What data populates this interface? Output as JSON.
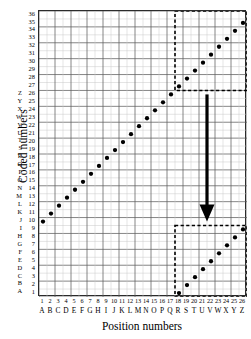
{
  "chart_data": {
    "type": "scatter",
    "title": "",
    "xlabel": "Position numbers",
    "ylabel": "Coded numbers",
    "xlim": [
      0.5,
      26.5
    ],
    "ylim": [
      0.5,
      36.5
    ],
    "grid": true,
    "legend": false,
    "x_tick_numbers": [
      "1",
      "2",
      "3",
      "4",
      "5",
      "6",
      "7",
      "8",
      "9",
      "10",
      "11",
      "12",
      "13",
      "14",
      "15",
      "16",
      "17",
      "18",
      "19",
      "20",
      "21",
      "22",
      "23",
      "24",
      "25",
      "26"
    ],
    "x_tick_letters": [
      "A",
      "B",
      "C",
      "D",
      "E",
      "F",
      "G",
      "H",
      "I",
      "J",
      "K",
      "L",
      "M",
      "N",
      "O",
      "P",
      "Q",
      "R",
      "S",
      "T",
      "U",
      "V",
      "W",
      "X",
      "Y",
      "Z"
    ],
    "y_tick_numbers": [
      "1",
      "2",
      "3",
      "4",
      "5",
      "6",
      "7",
      "8",
      "9",
      "10",
      "11",
      "12",
      "13",
      "14",
      "15",
      "16",
      "17",
      "18",
      "19",
      "20",
      "21",
      "22",
      "23",
      "24",
      "25",
      "26",
      "27",
      "28",
      "29",
      "30",
      "31",
      "32",
      "33",
      "34",
      "35",
      "36"
    ],
    "y_tick_letters": [
      "A",
      "B",
      "C",
      "D",
      "E",
      "F",
      "G",
      "H",
      "I",
      "J",
      "K",
      "L",
      "M",
      "N",
      "O",
      "P",
      "Q",
      "R",
      "S",
      "T",
      "U",
      "V",
      "W",
      "X",
      "Y",
      "Z",
      "",
      "",
      "",
      "",
      "",
      "",
      "",
      "",
      "",
      ""
    ],
    "series": [
      {
        "name": "coded mapping",
        "marker": "filled-circle",
        "color": "#000000",
        "x": [
          1,
          2,
          3,
          4,
          5,
          6,
          7,
          8,
          9,
          10,
          11,
          12,
          13,
          14,
          15,
          16,
          17,
          18,
          19,
          20,
          21,
          22,
          23,
          24,
          25,
          26
        ],
        "y": [
          10,
          11,
          12,
          13,
          14,
          15,
          16,
          17,
          18,
          19,
          20,
          21,
          22,
          23,
          24,
          25,
          26,
          27,
          28,
          29,
          30,
          31,
          32,
          33,
          34,
          35
        ]
      },
      {
        "name": "wrapped mapping",
        "marker": "filled-circle",
        "color": "#000000",
        "x": [
          18,
          19,
          20,
          21,
          22,
          23,
          24,
          25,
          26
        ],
        "y": [
          1,
          2,
          3,
          4,
          5,
          6,
          7,
          8,
          9
        ]
      }
    ],
    "annotations": [
      {
        "type": "dashed-rectangle",
        "name": "upper-highlight-box",
        "x0": 17.5,
        "x1": 26.5,
        "y0": 26.5,
        "y1": 36.5,
        "color": "#000000"
      },
      {
        "type": "dashed-rectangle",
        "name": "lower-highlight-box",
        "x0": 17.5,
        "x1": 26.5,
        "y0": 0.5,
        "y1": 9.5,
        "color": "#000000"
      },
      {
        "type": "down-arrow",
        "name": "wrap-arrow",
        "x": 21.5,
        "y0": 26.0,
        "y1": 10.0,
        "color": "#000000"
      }
    ]
  },
  "figure": {
    "axes": {
      "y_title": "Coded numbers",
      "x_title": "Position numbers"
    }
  }
}
